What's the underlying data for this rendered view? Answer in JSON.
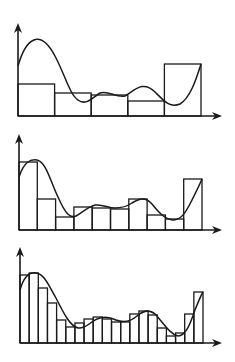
{
  "figure": {
    "stroke_color": "#1a1a1a",
    "background_color": "#ffffff",
    "panels": [
      {
        "name": "panel-5-rectangles",
        "rectangle_count": 5,
        "origin": [
          18,
          116
        ],
        "y_axis_top": 23,
        "x_axis_end": 222,
        "x_start": 18,
        "x_end": 201,
        "bar_tops": [
          84,
          93,
          95,
          101,
          64
        ],
        "curve": "M18,66 C26,38 40,28 55,56 C65,75 70,95 78,100 C86,106 92,98 100,93 C108,90 116,98 125,96 C135,90 143,80 155,92 C165,102 170,108 180,104 C190,98 196,80 201,64"
      },
      {
        "name": "panel-10-rectangles",
        "rectangle_count": 10,
        "origin": [
          19,
          230
        ],
        "y_axis_top": 134,
        "x_axis_end": 222,
        "x_start": 19,
        "x_end": 202,
        "bar_tops": [
          162,
          199,
          217,
          207,
          208,
          209,
          199,
          215,
          219,
          179
        ],
        "curve": "M19,177 C24,162 30,159 37,160 C46,162 50,180 58,197 C66,215 70,218 76,216 C84,211 88,207 95,205 C103,204 108,208 115,208 C122,208 126,207 132,203 C140,198 146,197 152,204 C160,214 166,220 174,220 C182,219 186,212 192,200 C197,190 200,184 202,179"
      },
      {
        "name": "panel-20-rectangles",
        "rectangle_count": 20,
        "origin": [
          20,
          343
        ],
        "y_axis_top": 247,
        "x_axis_end": 222,
        "x_start": 20,
        "x_end": 203,
        "bar_tops": [
          275,
          273,
          288,
          303,
          320,
          327,
          323,
          319,
          317,
          319,
          322,
          322,
          314,
          311,
          315,
          328,
          336,
          333,
          314,
          292
        ],
        "curve": "M20,290 C24,276 30,272 36,273 C44,274 48,284 56,298 C64,314 70,326 78,328 C86,329 90,322 97,319 C104,316 110,317 116,320 C124,323 130,322 137,316 C144,310 150,309 156,315 C164,324 170,334 178,336 C186,336 190,324 195,310 C199,300 201,295 203,292"
      }
    ]
  }
}
